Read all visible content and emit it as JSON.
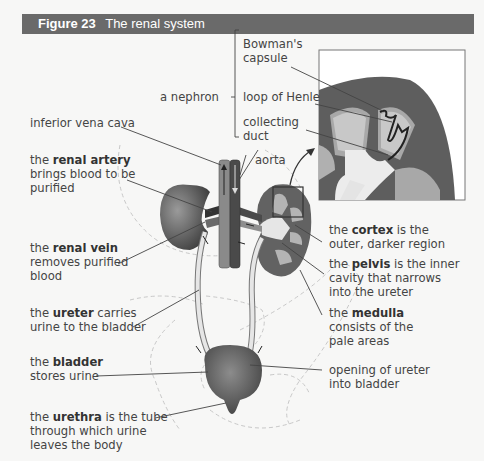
{
  "figure": {
    "number_label": "Figure 23",
    "title": "The renal system"
  },
  "nephron": {
    "group_label": "a nephron",
    "parts": [
      "Bowman's capsule",
      "loop of Henle",
      "collecting duct"
    ]
  },
  "labels": {
    "inferior_vena_cava": "inferior vena cava",
    "aorta": "aorta",
    "renal_artery": {
      "pre": "the ",
      "bold": "renal artery",
      "post": "",
      "line2": "brings blood to be",
      "line3": "purified"
    },
    "renal_vein": {
      "pre": "the ",
      "bold": "renal vein",
      "post": "",
      "line2": "removes purified",
      "line3": "blood"
    },
    "ureter": {
      "pre": "the ",
      "bold": "ureter",
      "post": " carries",
      "line2": "urine to the bladder"
    },
    "bladder": {
      "pre": "the ",
      "bold": "bladder",
      "post": "",
      "line2": "stores urine"
    },
    "urethra": {
      "pre": "the ",
      "bold": "urethra",
      "post": " is the tube",
      "line2": "through which urine",
      "line3": "leaves the body"
    },
    "cortex": {
      "pre": "the ",
      "bold": "cortex",
      "post": " is the",
      "line2": "outer, darker region"
    },
    "pelvis": {
      "pre": "the ",
      "bold": "pelvis",
      "post": " is the inner",
      "line2": "cavity that narrows",
      "line3": "into the ureter"
    },
    "medulla": {
      "pre": "the ",
      "bold": "medulla",
      "post": "",
      "line2": "consists of the",
      "line3": "pale areas"
    },
    "ureter_opening": {
      "line1": "opening of ureter",
      "line2": "into bladder"
    }
  },
  "colors": {
    "header_bg": "#6a6a6a",
    "cortex": "#5e5e5e",
    "medulla": "#b4b4b4",
    "pelvis": "#e6e6e6",
    "vessel_dark": "#4a4a4a",
    "vessel_light": "#8a8a8a"
  }
}
